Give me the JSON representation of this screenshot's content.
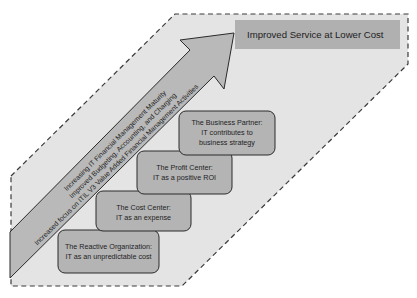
{
  "colors": {
    "background_region": "#e4e4e4",
    "arrow_fill": "#b9b9b9",
    "box_fill": "#b4b4b4",
    "goal_fill": "#b0b0b0",
    "stroke": "#2a2a2a",
    "text": "#1e1e1e"
  },
  "goal": {
    "label": "Improved Service at Lower Cost"
  },
  "arrow": {
    "lines": [
      "Increasing IT Financial Management Maturity",
      "Improved Budgeting, Accounting, and Charging",
      "Increased focus on ITIL V3 Value Added Financial Management Activities"
    ]
  },
  "stages": [
    {
      "title": "The Reactive Organization:",
      "lines": [
        "IT as an unpredictable cost"
      ]
    },
    {
      "title": "The Cost Center:",
      "lines": [
        "IT as an expense"
      ]
    },
    {
      "title": "The Profit Center:",
      "lines": [
        "IT as a positive ROI"
      ]
    },
    {
      "title": "The Business Partner:",
      "lines": [
        "IT contributes to",
        "business strategy"
      ]
    }
  ]
}
